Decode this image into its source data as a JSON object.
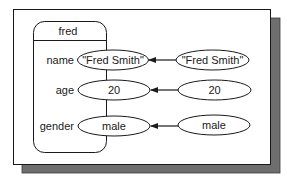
{
  "diagram": {
    "object": {
      "name": "fred",
      "fields": [
        {
          "label": "name",
          "value": "\"Fred Smith\""
        },
        {
          "label": "age",
          "value": "20"
        },
        {
          "label": "gender",
          "value": "male"
        }
      ]
    },
    "incoming_values": [
      {
        "value": "\"Fred Smith\"",
        "target_field": "name"
      },
      {
        "value": "20",
        "target_field": "age"
      },
      {
        "value": "male",
        "target_field": "gender"
      }
    ]
  },
  "colors": {
    "stroke": "#1a1a1a",
    "shadow": "#6e6e6e",
    "background": "#ffffff"
  }
}
